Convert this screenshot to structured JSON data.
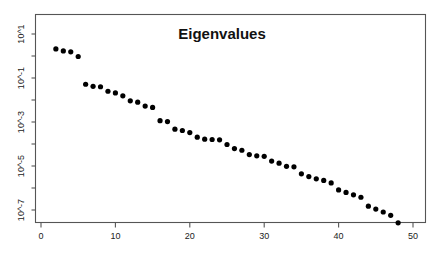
{
  "chart_data": {
    "type": "scatter",
    "title": "Eigenvalues",
    "xlabel": "",
    "ylabel": "",
    "yscale": "log",
    "xscale": "linear",
    "grid": false,
    "legend": null,
    "xlim": [
      0,
      52
    ],
    "ylim": [
      1e-08,
      1000.0
    ],
    "xticks": [
      0,
      10,
      20,
      30,
      40,
      50
    ],
    "xticklabels": [
      "0",
      "10",
      "20",
      "30",
      "40",
      "50"
    ],
    "yticks": [
      10,
      0.1,
      0.001,
      1e-05,
      1e-07
    ],
    "yticklabels": [
      "10^1",
      "10^-1",
      "10^-3",
      "10^-5",
      "10^-7"
    ],
    "yticklabels_rotated": true,
    "marker": "filled-circle",
    "marker_color": "#000000",
    "x": [
      1,
      2,
      3,
      4,
      5,
      6,
      7,
      8,
      9,
      10,
      11,
      12,
      13,
      14,
      15,
      16,
      17,
      18,
      19,
      20,
      21,
      22,
      23,
      24,
      25,
      26,
      27,
      28,
      29,
      30,
      31,
      32,
      33,
      34,
      35,
      36,
      37,
      38,
      39,
      40,
      41,
      42,
      43,
      44,
      45,
      46,
      47,
      48,
      49,
      50
    ],
    "y": [
      130.0,
      2.1,
      1.7,
      1.55,
      0.95,
      0.052,
      0.042,
      0.04,
      0.025,
      0.021,
      0.0155,
      0.0092,
      0.008,
      0.0053,
      0.0046,
      0.00115,
      0.00105,
      0.00047,
      0.00041,
      0.00033,
      0.000205,
      0.000165,
      0.00016,
      0.000155,
      9.5e-05,
      6.2e-05,
      5.2e-05,
      3.3e-05,
      2.9e-05,
      2.75e-05,
      1.68e-05,
      1.35e-05,
      9.7e-06,
      9.2e-06,
      4.4e-06,
      3.3e-06,
      2.6e-06,
      2.2e-06,
      1.7e-06,
      8.2e-07,
      6.3e-07,
      4.9e-07,
      3.8e-07,
      1.5e-07,
      1.1e-07,
      8.1e-08,
      5.7e-08,
      2.6e-08,
      1.8e-08,
      1.1e-08
    ],
    "point_count": 50
  },
  "figure": {
    "title": "Eigenvalues",
    "background_color": "#ffffff",
    "frame_color": "#555555",
    "point_color": "#000000"
  }
}
